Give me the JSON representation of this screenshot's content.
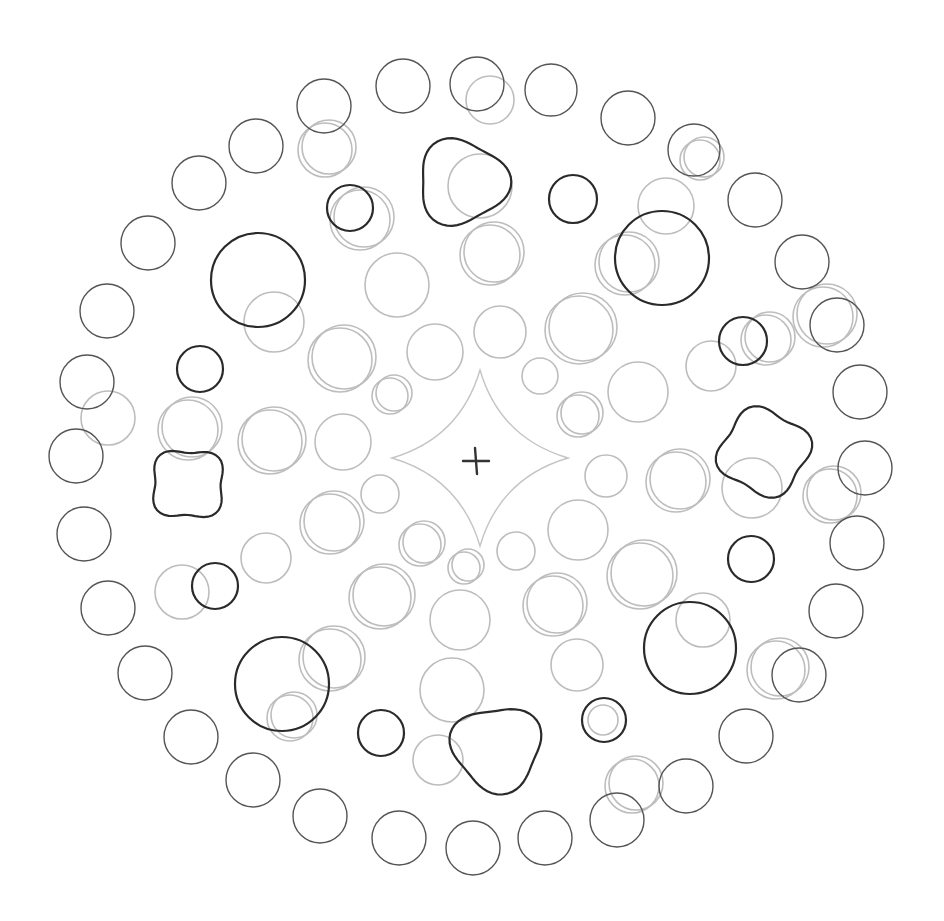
{
  "artwork": {
    "type": "pencil drawing",
    "background": "#ffffff",
    "colors": {
      "dark": "#2a2a2a",
      "mid": "#555555",
      "light": "#bbbbbb"
    },
    "center_mark": "+",
    "outer_ring": [
      [
        403,
        86,
        27
      ],
      [
        477,
        84,
        27
      ],
      [
        551,
        90,
        26
      ],
      [
        628,
        118,
        27
      ],
      [
        694,
        150,
        26
      ],
      [
        755,
        200,
        27
      ],
      [
        802,
        262,
        27
      ],
      [
        837,
        325,
        27
      ],
      [
        860,
        392,
        27
      ],
      [
        865,
        468,
        27
      ],
      [
        857,
        543,
        27
      ],
      [
        836,
        611,
        27
      ],
      [
        799,
        675,
        27
      ],
      [
        746,
        736,
        27
      ],
      [
        686,
        786,
        27
      ],
      [
        617,
        820,
        27
      ],
      [
        545,
        838,
        27
      ],
      [
        473,
        848,
        27
      ],
      [
        399,
        838,
        27
      ],
      [
        320,
        816,
        27
      ],
      [
        253,
        780,
        27
      ],
      [
        191,
        737,
        27
      ],
      [
        145,
        673,
        27
      ],
      [
        108,
        608,
        27
      ],
      [
        84,
        534,
        27
      ],
      [
        76,
        456,
        27
      ],
      [
        87,
        382,
        27
      ],
      [
        107,
        311,
        27
      ],
      [
        148,
        243,
        27
      ],
      [
        199,
        183,
        27
      ],
      [
        256,
        146,
        27
      ],
      [
        324,
        106,
        27
      ]
    ],
    "dark_circles": [
      [
        258,
        280,
        47
      ],
      [
        662,
        258,
        47
      ],
      [
        690,
        648,
        46
      ],
      [
        282,
        684,
        47
      ],
      [
        200,
        369,
        23
      ],
      [
        350,
        208,
        23
      ],
      [
        573,
        199,
        24
      ],
      [
        743,
        341,
        24
      ],
      [
        751,
        559,
        23
      ],
      [
        381,
        733,
        23
      ],
      [
        604,
        720,
        22
      ],
      [
        215,
        586,
        23
      ]
    ],
    "dark_blobs": [
      {
        "cx": 462,
        "cy": 182,
        "r": 44
      },
      {
        "cx": 764,
        "cy": 452,
        "r": 44
      },
      {
        "cx": 497,
        "cy": 748,
        "r": 44
      },
      {
        "cx": 188,
        "cy": 484,
        "r": 37
      }
    ],
    "light_circles": [
      [
        325,
        150,
        27
      ],
      [
        490,
        100,
        24
      ],
      [
        700,
        160,
        20
      ],
      [
        480,
        186,
        32
      ],
      [
        360,
        220,
        30
      ],
      [
        666,
        206,
        28
      ],
      [
        490,
        255,
        30
      ],
      [
        397,
        285,
        32
      ],
      [
        625,
        265,
        30
      ],
      [
        274,
        322,
        30
      ],
      [
        579,
        330,
        34
      ],
      [
        500,
        332,
        26
      ],
      [
        340,
        360,
        32
      ],
      [
        435,
        352,
        28
      ],
      [
        823,
        317,
        30
      ],
      [
        711,
        366,
        25
      ],
      [
        766,
        340,
        25
      ],
      [
        540,
        376,
        18
      ],
      [
        390,
        396,
        18
      ],
      [
        638,
        392,
        30
      ],
      [
        188,
        430,
        30
      ],
      [
        108,
        418,
        27
      ],
      [
        270,
        442,
        32
      ],
      [
        343,
        442,
        28
      ],
      [
        578,
        416,
        21
      ],
      [
        606,
        476,
        21
      ],
      [
        676,
        482,
        30
      ],
      [
        752,
        488,
        30
      ],
      [
        830,
        496,
        27
      ],
      [
        380,
        494,
        19
      ],
      [
        330,
        524,
        30
      ],
      [
        578,
        530,
        30
      ],
      [
        420,
        545,
        21
      ],
      [
        516,
        551,
        19
      ],
      [
        464,
        568,
        16
      ],
      [
        266,
        558,
        25
      ],
      [
        640,
        576,
        33
      ],
      [
        182,
        592,
        27
      ],
      [
        380,
        598,
        31
      ],
      [
        460,
        620,
        30
      ],
      [
        553,
        606,
        30
      ],
      [
        703,
        620,
        27
      ],
      [
        330,
        660,
        31
      ],
      [
        577,
        665,
        26
      ],
      [
        776,
        670,
        29
      ],
      [
        452,
        690,
        32
      ],
      [
        290,
        718,
        23
      ],
      [
        438,
        760,
        25
      ],
      [
        632,
        786,
        27
      ],
      [
        603,
        720,
        15
      ]
    ],
    "center_shape": {
      "cx": 480,
      "cy": 458,
      "r": 88
    }
  }
}
